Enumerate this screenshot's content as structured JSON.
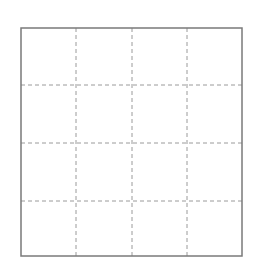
{
  "diagram": {
    "type": "grid",
    "rows": 4,
    "columns": 4,
    "cells": 16,
    "border": {
      "x": 21,
      "y": 28,
      "width": 221,
      "height": 228,
      "color": "#7a7a7a",
      "stroke_width": 1.5
    },
    "dashed_lines": {
      "color": "#9a9a9a",
      "stroke_width": 1,
      "dash": "4 3",
      "vertical_x": [
        76,
        132,
        187
      ],
      "horizontal_y": [
        85,
        143,
        201
      ]
    },
    "background": "#ffffff"
  }
}
